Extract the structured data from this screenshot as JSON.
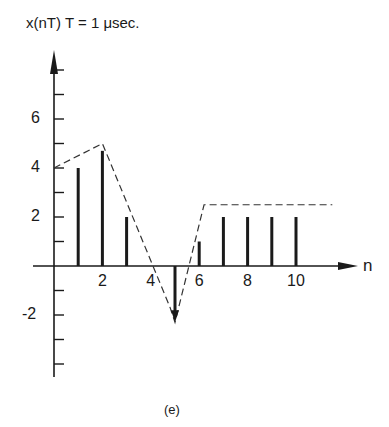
{
  "chart_data": {
    "type": "stem",
    "title": "x(nT)   T = 1 μsec.",
    "ylabel": "x(nT)",
    "xlabel": "n",
    "annotation": "T = 1 μsec.",
    "caption": "(e)",
    "x_tick_labels": [
      "2",
      "4",
      "6",
      "8",
      "10"
    ],
    "x_ticks": [
      2,
      4,
      6,
      8,
      10
    ],
    "y_tick_labels": [
      "6",
      "4",
      "2",
      "-2"
    ],
    "y_ticks": [
      6,
      4,
      2,
      -2
    ],
    "ylim": [
      -4.5,
      8
    ],
    "xlim": [
      0,
      12.5
    ],
    "grid": false,
    "legend": null,
    "series": [
      {
        "name": "samples",
        "style": "stem",
        "x": [
          1,
          2,
          3,
          5,
          6,
          7,
          8,
          9,
          10
        ],
        "values": [
          4,
          4.7,
          2,
          -2.3,
          1,
          2,
          2,
          2,
          2
        ]
      },
      {
        "name": "envelope",
        "style": "dashed-line",
        "x": [
          0,
          2,
          4.8,
          5,
          6.2,
          11.5
        ],
        "values": [
          4,
          5,
          -1.7,
          -2.3,
          2.5,
          2.5
        ]
      }
    ]
  },
  "labels": {
    "title": "x(nT)   T = 1 μsec.",
    "x_axis": "n",
    "caption": "(e)"
  }
}
